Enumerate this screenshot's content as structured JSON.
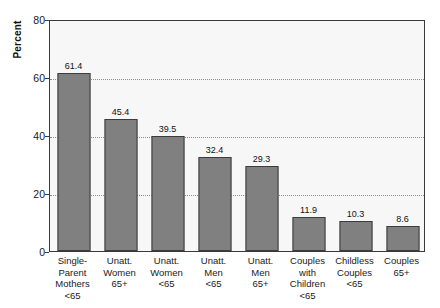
{
  "chart_data": {
    "type": "bar",
    "title": "",
    "subtitle": "",
    "xlabel": "",
    "ylabel": "Percent",
    "ylim": [
      0,
      80
    ],
    "yticks": [
      0,
      20,
      40,
      60,
      80
    ],
    "ytick_labels": [
      "0",
      "20",
      "40",
      "60",
      "80"
    ],
    "gridlines": [
      20,
      40,
      60
    ],
    "grid": true,
    "legend": false,
    "legend_position": "none",
    "categories": [
      "Single-Parent Mothers <65",
      "Unatt. Women 65+",
      "Unatt. Women <65",
      "Unatt. Men <65",
      "Unatt. Men 65+",
      "Couples with Children <65",
      "Childless Couples <65",
      "Couples 65+"
    ],
    "category_lines": [
      [
        "Single-",
        "Parent",
        "Mothers",
        "<65"
      ],
      [
        "Unatt.",
        "Women",
        "65+"
      ],
      [
        "Unatt.",
        "Women",
        "<65"
      ],
      [
        "Unatt.",
        "Men",
        "<65"
      ],
      [
        "Unatt.",
        "Men",
        "65+"
      ],
      [
        "Couples",
        "with",
        "Children",
        "<65"
      ],
      [
        "Childless",
        "Couples",
        "<65"
      ],
      [
        "Couples",
        "65+"
      ]
    ],
    "values": [
      61.4,
      45.4,
      39.5,
      32.4,
      29.3,
      11.9,
      10.3,
      8.6
    ],
    "value_labels": [
      "61.4",
      "45.4",
      "39.5",
      "32.4",
      "29.3",
      "11.9",
      "10.3",
      "8.6"
    ],
    "colors": {
      "bar_fill": "#808080",
      "bar_stroke": "#3c3c3c",
      "plot_background": "#f7f7f7",
      "plot_border": "#3a3a3a",
      "gridline": "#8d8d8d",
      "text": "#1a1a1a",
      "page_background": "#ffffff"
    }
  }
}
